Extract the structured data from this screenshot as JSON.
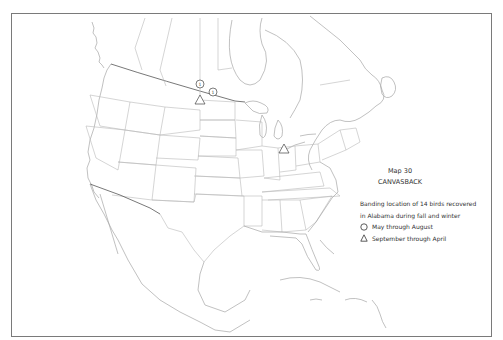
{
  "map": {
    "number_label": "Map 30",
    "species": "CANVASBACK",
    "description_line1": "Banding location of 14 birds recovered",
    "description_line2": "in Alabama during fall and winter",
    "legend": [
      {
        "symbol": "circle-icon",
        "label": "May through August"
      },
      {
        "symbol": "triangle-icon",
        "label": "September through April"
      }
    ]
  },
  "markers": [
    {
      "type": "circle",
      "value": "1",
      "region": "Saskatchewan",
      "x": 200,
      "y": 84
    },
    {
      "type": "circle",
      "value": "1",
      "region": "Manitoba",
      "x": 212,
      "y": 92
    },
    {
      "type": "triangle",
      "region": "North Dakota",
      "x": 200,
      "y": 100
    },
    {
      "type": "triangle",
      "region": "Michigan",
      "x": 284,
      "y": 149
    }
  ],
  "colors": {
    "line": "#b8b8b8",
    "border": "#555555",
    "text": "#333333",
    "frame": "#7a7a7a"
  }
}
